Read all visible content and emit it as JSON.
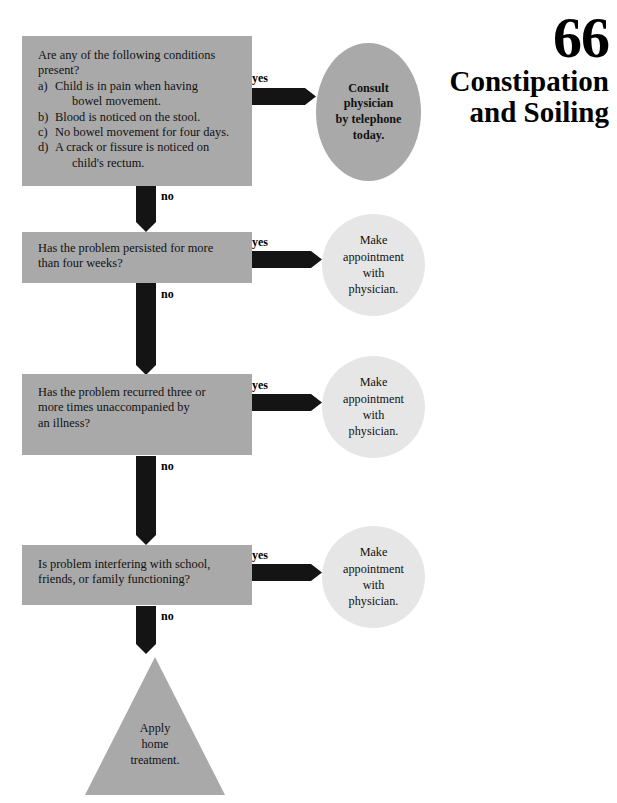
{
  "header": {
    "chapter_number": "66",
    "title_line1": "Constipation",
    "title_line2": "and Soiling"
  },
  "flowchart": {
    "type": "decision-tree",
    "boxes": [
      {
        "id": "box1",
        "lead": "Are any of the following conditions present?",
        "items": [
          {
            "marker": "a)",
            "text": "Child is in pain when having",
            "cont": "bowel movement."
          },
          {
            "marker": "b)",
            "text": "Blood is noticed on the stool.",
            "cont": ""
          },
          {
            "marker": "c)",
            "text": "No bowel movement for four days.",
            "cont": ""
          },
          {
            "marker": "d)",
            "text": "A crack or fissure is noticed on",
            "cont": "child's rectum."
          }
        ]
      },
      {
        "id": "box2",
        "line1": "Has the problem persisted for more",
        "line2": "than four weeks?"
      },
      {
        "id": "box3",
        "line1": "Has the problem recurred three or",
        "line2": "more times unaccompanied by",
        "line3": "an illness?"
      },
      {
        "id": "box4",
        "line1": "Is problem interfering with school,",
        "line2": "friends, or family functioning?"
      }
    ],
    "outcomes": [
      {
        "id": "circle1",
        "emphasis": "bold",
        "line1": "Consult",
        "line2": "physician",
        "line3": "by telephone",
        "line4": "today."
      },
      {
        "id": "circle2",
        "emphasis": "normal",
        "line1": "Make",
        "line2": "appointment",
        "line3": "with",
        "line4": "physician."
      },
      {
        "id": "circle3",
        "emphasis": "normal",
        "line1": "Make",
        "line2": "appointment",
        "line3": "with",
        "line4": "physician."
      },
      {
        "id": "circle4",
        "emphasis": "normal",
        "line1": "Make",
        "line2": "appointment",
        "line3": "with",
        "line4": "physician."
      }
    ],
    "terminal": {
      "id": "triangle",
      "line1": "Apply",
      "line2": "home",
      "line3": "treatment."
    },
    "edge_labels": {
      "yes": "yes",
      "no": "no"
    }
  },
  "colors": {
    "box_fill": "#a9a9a9",
    "circle_fill_emphasis": "#a9a9a9",
    "circle_fill_light": "#e6e6e6",
    "arrow_fill": "#141414",
    "page_background": "#ffffff",
    "text": "#111111"
  }
}
